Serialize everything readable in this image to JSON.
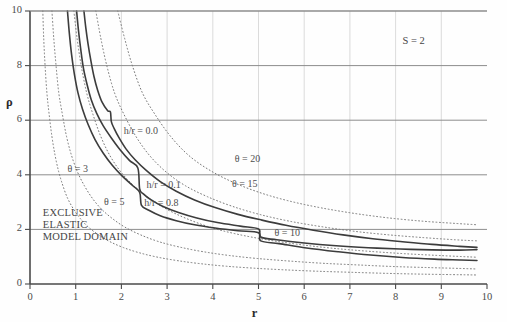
{
  "chart_data": {
    "type": "line",
    "title": "",
    "xlabel": "r",
    "ylabel": "ρ",
    "xlim": [
      0,
      10
    ],
    "ylim": [
      0,
      10
    ],
    "xticks": [
      "0",
      "1",
      "2",
      "3",
      "4",
      "5",
      "6",
      "7",
      "8",
      "9",
      "10"
    ],
    "yticks": [
      "0",
      "2",
      "4",
      "6",
      "8",
      "10"
    ],
    "xtick_values": [
      0,
      1,
      2,
      3,
      4,
      5,
      6,
      7,
      8,
      9,
      10
    ],
    "ytick_values": [
      0,
      2,
      4,
      6,
      8,
      10
    ],
    "grid": "both",
    "grid_x_step": 1,
    "grid_y_step": 2,
    "legend_position": "inline-annotations",
    "annotations": [
      {
        "text": "S = 2",
        "x": 8.15,
        "y": 8.85
      },
      {
        "text": "EXCLUSIVE",
        "x": 0.28,
        "y": 2.55
      },
      {
        "text": "ELASTIC",
        "x": 0.28,
        "y": 2.12
      },
      {
        "text": "MODEL  DOMAIN",
        "x": 0.28,
        "y": 1.68
      }
    ],
    "series": [
      {
        "name": "h/r = 0.0",
        "style": "solid",
        "color": "#3c3c3c",
        "label": "h/r = 0.0",
        "label_x": 2.05,
        "label_y": 5.55,
        "points": [
          [
            1.18,
            10.0
          ],
          [
            1.22,
            9.4
          ],
          [
            1.27,
            8.8
          ],
          [
            1.33,
            8.2
          ],
          [
            1.4,
            7.6
          ],
          [
            1.48,
            7.1
          ],
          [
            1.58,
            6.65
          ],
          [
            1.7,
            6.35
          ],
          [
            1.76,
            6.3
          ],
          [
            1.78,
            5.95
          ],
          [
            1.84,
            5.7
          ],
          [
            1.95,
            5.35
          ],
          [
            2.1,
            4.95
          ],
          [
            2.3,
            4.55
          ],
          [
            2.55,
            4.15
          ],
          [
            2.85,
            3.75
          ],
          [
            3.2,
            3.4
          ],
          [
            3.6,
            3.08
          ],
          [
            4.05,
            2.8
          ],
          [
            4.55,
            2.55
          ],
          [
            5.05,
            2.35
          ],
          [
            5.6,
            2.15
          ],
          [
            6.2,
            1.97
          ],
          [
            6.85,
            1.8
          ],
          [
            7.5,
            1.66
          ],
          [
            8.15,
            1.55
          ],
          [
            8.8,
            1.45
          ],
          [
            9.4,
            1.38
          ],
          [
            9.78,
            1.34
          ]
        ]
      },
      {
        "name": "h/r = 0.1",
        "style": "solid",
        "color": "#3c3c3c",
        "label": "h/r = 0.1",
        "label_x": 2.55,
        "label_y": 3.6,
        "points": [
          [
            1.02,
            10.0
          ],
          [
            1.06,
            9.3
          ],
          [
            1.11,
            8.6
          ],
          [
            1.17,
            7.9
          ],
          [
            1.25,
            7.3
          ],
          [
            1.34,
            6.75
          ],
          [
            1.46,
            6.25
          ],
          [
            1.6,
            5.8
          ],
          [
            1.78,
            5.35
          ],
          [
            1.98,
            4.9
          ],
          [
            2.18,
            4.52
          ],
          [
            2.36,
            4.25
          ],
          [
            2.4,
            3.48
          ],
          [
            2.48,
            3.3
          ],
          [
            2.65,
            3.08
          ],
          [
            2.9,
            2.85
          ],
          [
            3.25,
            2.62
          ],
          [
            3.65,
            2.42
          ],
          [
            4.1,
            2.25
          ],
          [
            4.6,
            2.12
          ],
          [
            5.0,
            2.02
          ],
          [
            5.05,
            1.72
          ],
          [
            5.4,
            1.62
          ],
          [
            6.0,
            1.5
          ],
          [
            6.7,
            1.4
          ],
          [
            7.4,
            1.33
          ],
          [
            8.1,
            1.28
          ],
          [
            8.8,
            1.25
          ],
          [
            9.4,
            1.24
          ],
          [
            9.78,
            1.26
          ]
        ]
      },
      {
        "name": "h/r = 0.8",
        "style": "solid",
        "color": "#3c3c3c",
        "label": "h/r = 0.8",
        "label_x": 2.5,
        "label_y": 2.93,
        "points": [
          [
            0.82,
            10.0
          ],
          [
            0.86,
            9.2
          ],
          [
            0.91,
            8.4
          ],
          [
            0.97,
            7.7
          ],
          [
            1.05,
            7.0
          ],
          [
            1.15,
            6.4
          ],
          [
            1.27,
            5.85
          ],
          [
            1.42,
            5.3
          ],
          [
            1.6,
            4.8
          ],
          [
            1.8,
            4.35
          ],
          [
            2.02,
            3.95
          ],
          [
            2.25,
            3.6
          ],
          [
            2.4,
            3.35
          ],
          [
            2.44,
            2.88
          ],
          [
            2.6,
            2.7
          ],
          [
            2.85,
            2.5
          ],
          [
            3.2,
            2.32
          ],
          [
            3.6,
            2.17
          ],
          [
            4.05,
            2.05
          ],
          [
            4.55,
            1.95
          ],
          [
            5.0,
            1.88
          ],
          [
            5.05,
            1.58
          ],
          [
            5.45,
            1.48
          ],
          [
            6.05,
            1.32
          ],
          [
            6.75,
            1.18
          ],
          [
            7.45,
            1.06
          ],
          [
            8.15,
            0.97
          ],
          [
            8.85,
            0.91
          ],
          [
            9.4,
            0.88
          ],
          [
            9.78,
            0.86
          ]
        ]
      },
      {
        "name": "θ = 3",
        "style": "dotted",
        "color": "#777777",
        "label": "θ =  3",
        "label_x": 0.82,
        "label_y": 4.18,
        "points": [
          [
            0.28,
            10.0
          ],
          [
            0.3,
            9.0
          ],
          [
            0.33,
            8.0
          ],
          [
            0.37,
            7.0
          ],
          [
            0.42,
            6.2
          ],
          [
            0.48,
            5.4
          ],
          [
            0.55,
            4.7
          ],
          [
            0.63,
            4.1
          ],
          [
            0.72,
            3.6
          ],
          [
            0.82,
            3.15
          ],
          [
            0.95,
            2.75
          ],
          [
            1.1,
            2.4
          ],
          [
            1.28,
            2.08
          ],
          [
            1.5,
            1.8
          ],
          [
            1.75,
            1.55
          ],
          [
            2.05,
            1.33
          ],
          [
            2.4,
            1.14
          ],
          [
            2.8,
            0.98
          ],
          [
            3.25,
            0.85
          ],
          [
            3.75,
            0.74
          ],
          [
            4.3,
            0.65
          ],
          [
            4.9,
            0.58
          ],
          [
            5.55,
            0.52
          ],
          [
            6.25,
            0.47
          ],
          [
            7.0,
            0.43
          ],
          [
            7.8,
            0.39
          ],
          [
            8.6,
            0.36
          ],
          [
            9.4,
            0.34
          ],
          [
            9.78,
            0.33
          ]
        ]
      },
      {
        "name": "θ = 5",
        "style": "dotted",
        "color": "#777777",
        "label": "θ =  5",
        "label_x": 1.62,
        "label_y": 2.95,
        "points": [
          [
            0.48,
            10.0
          ],
          [
            0.52,
            9.0
          ],
          [
            0.57,
            8.0
          ],
          [
            0.63,
            7.0
          ],
          [
            0.71,
            6.2
          ],
          [
            0.8,
            5.4
          ],
          [
            0.91,
            4.7
          ],
          [
            1.04,
            4.1
          ],
          [
            1.19,
            3.6
          ],
          [
            1.36,
            3.15
          ],
          [
            1.56,
            2.75
          ],
          [
            1.8,
            2.4
          ],
          [
            2.08,
            2.08
          ],
          [
            2.42,
            1.8
          ],
          [
            2.82,
            1.55
          ],
          [
            3.28,
            1.35
          ],
          [
            3.8,
            1.18
          ],
          [
            4.38,
            1.04
          ],
          [
            5.0,
            0.93
          ],
          [
            5.68,
            0.84
          ],
          [
            6.4,
            0.76
          ],
          [
            7.15,
            0.7
          ],
          [
            7.95,
            0.64
          ],
          [
            8.75,
            0.6
          ],
          [
            9.4,
            0.57
          ],
          [
            9.78,
            0.55
          ]
        ]
      },
      {
        "name": "θ = 10",
        "style": "dotted",
        "color": "#777777",
        "label": "θ  = 10",
        "label_x": 5.35,
        "label_y": 1.82,
        "points": [
          [
            0.96,
            10.0
          ],
          [
            1.03,
            9.0
          ],
          [
            1.12,
            8.0
          ],
          [
            1.24,
            7.0
          ],
          [
            1.38,
            6.2
          ],
          [
            1.55,
            5.4
          ],
          [
            1.75,
            4.7
          ],
          [
            1.99,
            4.1
          ],
          [
            2.27,
            3.6
          ],
          [
            2.6,
            3.15
          ],
          [
            2.98,
            2.75
          ],
          [
            3.42,
            2.4
          ],
          [
            3.94,
            2.08
          ],
          [
            4.52,
            1.83
          ],
          [
            5.18,
            1.62
          ],
          [
            5.88,
            1.45
          ],
          [
            6.62,
            1.31
          ],
          [
            7.4,
            1.2
          ],
          [
            8.2,
            1.11
          ],
          [
            9.0,
            1.04
          ],
          [
            9.78,
            0.98
          ]
        ]
      },
      {
        "name": "θ = 15",
        "style": "dotted",
        "color": "#777777",
        "label": "θ = 15",
        "label_x": 4.42,
        "label_y": 3.62,
        "points": [
          [
            1.44,
            10.0
          ],
          [
            1.55,
            9.0
          ],
          [
            1.68,
            8.0
          ],
          [
            1.85,
            7.0
          ],
          [
            2.06,
            6.2
          ],
          [
            2.32,
            5.4
          ],
          [
            2.62,
            4.7
          ],
          [
            2.98,
            4.1
          ],
          [
            3.4,
            3.6
          ],
          [
            3.88,
            3.2
          ],
          [
            4.42,
            2.85
          ],
          [
            5.02,
            2.55
          ],
          [
            5.68,
            2.3
          ],
          [
            6.38,
            2.1
          ],
          [
            7.1,
            1.93
          ],
          [
            7.85,
            1.8
          ],
          [
            8.6,
            1.7
          ],
          [
            9.3,
            1.62
          ],
          [
            9.78,
            1.58
          ]
        ]
      },
      {
        "name": "θ = 20",
        "style": "dotted",
        "color": "#777777",
        "label": "θ = 20",
        "label_x": 4.48,
        "label_y": 4.55,
        "points": [
          [
            1.92,
            10.0
          ],
          [
            2.07,
            9.0
          ],
          [
            2.24,
            8.0
          ],
          [
            2.46,
            7.0
          ],
          [
            2.74,
            6.2
          ],
          [
            3.08,
            5.4
          ],
          [
            3.48,
            4.7
          ],
          [
            3.95,
            4.15
          ],
          [
            4.48,
            3.7
          ],
          [
            5.08,
            3.32
          ],
          [
            5.72,
            3.02
          ],
          [
            6.4,
            2.78
          ],
          [
            7.12,
            2.58
          ],
          [
            7.85,
            2.42
          ],
          [
            8.6,
            2.3
          ],
          [
            9.3,
            2.22
          ],
          [
            9.78,
            2.17
          ]
        ]
      }
    ]
  },
  "axes": {
    "x_label": "r",
    "y_label": "ρ"
  }
}
